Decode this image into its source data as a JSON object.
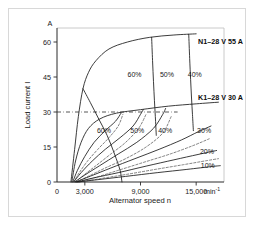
{
  "chart_data": {
    "type": "line",
    "title": "",
    "xlabel": "Alternator speed n",
    "ylabel": "Load current I",
    "x_unit": "min",
    "x_unit_exponent": "-1",
    "y_unit": "A",
    "xlim": [
      0,
      18000
    ],
    "ylim": [
      0,
      66
    ],
    "x_ticks": [
      0,
      3000,
      9000,
      15000
    ],
    "x_tick_labels": [
      "0",
      "3,000",
      "9,000",
      "15,000"
    ],
    "y_ticks": [
      0,
      15,
      30,
      45,
      60
    ],
    "y_tick_labels": [
      "0",
      "15",
      "30",
      "45",
      "60"
    ],
    "grid": false,
    "legend_position": "inline-right",
    "reference_lines": [
      {
        "name": "k1-rated-current",
        "axis": "y",
        "value": 30,
        "style": "dash-dot"
      }
    ],
    "annotations": [
      {
        "name": "series-label-n1",
        "text": "N1–28 V 55 A",
        "x": 15200,
        "y": 59
      },
      {
        "name": "series-label-k1",
        "text": "K1–28 V 30 A",
        "x": 15200,
        "y": 35
      },
      {
        "name": "duty-upper-60",
        "text": "60%",
        "x": 7600,
        "y": 45
      },
      {
        "name": "duty-upper-50",
        "text": "50%",
        "x": 11100,
        "y": 45
      },
      {
        "name": "duty-upper-40",
        "text": "40%",
        "x": 14100,
        "y": 45
      },
      {
        "name": "duty-lower-60",
        "text": "60%",
        "x": 4300,
        "y": 21
      },
      {
        "name": "duty-lower-50",
        "text": "50%",
        "x": 7900,
        "y": 21
      },
      {
        "name": "duty-lower-40",
        "text": "40%",
        "x": 10900,
        "y": 21
      },
      {
        "name": "duty-lower-30",
        "text": "30%",
        "x": 15100,
        "y": 21
      },
      {
        "name": "duty-lower-20",
        "text": "20%",
        "x": 15400,
        "y": 12
      },
      {
        "name": "duty-lower-10",
        "text": "10%",
        "x": 15500,
        "y": 6
      }
    ],
    "series": [
      {
        "name": "N1-28V-55A envelope",
        "style": "solid",
        "points": [
          [
            1500,
            0
          ],
          [
            1900,
            14
          ],
          [
            2300,
            28
          ],
          [
            2800,
            40
          ],
          [
            3400,
            47
          ],
          [
            4200,
            52
          ],
          [
            5600,
            57
          ],
          [
            7600,
            60
          ],
          [
            10000,
            62
          ],
          [
            12600,
            63
          ],
          [
            15000,
            63.5
          ]
        ]
      },
      {
        "name": "N1 duty 60%",
        "style": "solid",
        "points": [
          [
            2800,
            40
          ],
          [
            3600,
            34
          ],
          [
            4500,
            27
          ],
          [
            5400,
            20
          ],
          [
            6200,
            12
          ],
          [
            6800,
            5
          ],
          [
            7000,
            0
          ]
        ]
      },
      {
        "name": "N1 duty 50%",
        "style": "solid",
        "points": [
          [
            10200,
            62
          ],
          [
            10300,
            52
          ],
          [
            10400,
            43
          ],
          [
            10500,
            35
          ],
          [
            10600,
            28
          ],
          [
            10700,
            20
          ]
        ]
      },
      {
        "name": "N1 duty 40%",
        "style": "solid",
        "points": [
          [
            14200,
            63.3
          ],
          [
            14300,
            53
          ],
          [
            14400,
            44
          ],
          [
            14500,
            36
          ],
          [
            14600,
            29
          ],
          [
            14700,
            22
          ]
        ]
      },
      {
        "name": "K1-28V-30A envelope",
        "style": "solid",
        "points": [
          [
            1600,
            0
          ],
          [
            2000,
            9
          ],
          [
            2600,
            17
          ],
          [
            3400,
            23
          ],
          [
            4600,
            27
          ],
          [
            6400,
            29.5
          ],
          [
            9000,
            31
          ],
          [
            12000,
            32.5
          ],
          [
            15000,
            33.5
          ],
          [
            17400,
            34.2
          ]
        ]
      },
      {
        "name": "K1 duty 60% solid",
        "style": "solid",
        "points": [
          [
            1700,
            0
          ],
          [
            2200,
            5
          ],
          [
            3000,
            11
          ],
          [
            4000,
            17
          ],
          [
            5200,
            22
          ],
          [
            6300,
            26
          ],
          [
            6900,
            29.5
          ]
        ]
      },
      {
        "name": "K1 duty 60% dashed",
        "style": "dashed",
        "points": [
          [
            1800,
            0
          ],
          [
            2400,
            4
          ],
          [
            3300,
            9
          ],
          [
            4400,
            14
          ],
          [
            5600,
            19
          ],
          [
            6600,
            24
          ],
          [
            7100,
            29
          ]
        ]
      },
      {
        "name": "K1 duty 50% solid",
        "style": "solid",
        "points": [
          [
            1800,
            0
          ],
          [
            2600,
            4
          ],
          [
            3800,
            9
          ],
          [
            5200,
            14
          ],
          [
            6800,
            19
          ],
          [
            8200,
            24
          ],
          [
            9000,
            29
          ],
          [
            9300,
            31
          ]
        ]
      },
      {
        "name": "K1 duty 50% dashed",
        "style": "dashed",
        "points": [
          [
            2000,
            0
          ],
          [
            2900,
            3
          ],
          [
            4200,
            7
          ],
          [
            5800,
            12
          ],
          [
            7400,
            17
          ],
          [
            8800,
            23
          ],
          [
            9600,
            29
          ]
        ]
      },
      {
        "name": "K1 duty 40% solid",
        "style": "solid",
        "points": [
          [
            1900,
            0
          ],
          [
            3000,
            3
          ],
          [
            4600,
            7
          ],
          [
            6600,
            12
          ],
          [
            8600,
            17
          ],
          [
            10400,
            23
          ],
          [
            11400,
            29
          ],
          [
            11700,
            31.5
          ]
        ]
      },
      {
        "name": "K1 duty 40% dashed",
        "style": "dashed",
        "points": [
          [
            2100,
            0
          ],
          [
            3400,
            2.5
          ],
          [
            5200,
            6
          ],
          [
            7400,
            10
          ],
          [
            9600,
            15
          ],
          [
            11400,
            21
          ],
          [
            12300,
            28
          ]
        ]
      },
      {
        "name": "K1 duty 30%",
        "style": "solid",
        "points": [
          [
            2000,
            0
          ],
          [
            3600,
            2.5
          ],
          [
            5800,
            6
          ],
          [
            8400,
            10
          ],
          [
            11000,
            14
          ],
          [
            13400,
            18
          ],
          [
            15200,
            21.5
          ],
          [
            16600,
            24
          ]
        ]
      },
      {
        "name": "K1 duty 30% dashed",
        "style": "dashed",
        "points": [
          [
            2300,
            0
          ],
          [
            4200,
            2
          ],
          [
            6600,
            5
          ],
          [
            9400,
            8.5
          ],
          [
            12200,
            12
          ],
          [
            14600,
            15.5
          ],
          [
            16400,
            18.5
          ]
        ]
      },
      {
        "name": "K1 duty 20%",
        "style": "solid",
        "points": [
          [
            2100,
            0
          ],
          [
            4000,
            1.8
          ],
          [
            6600,
            4
          ],
          [
            9600,
            6.8
          ],
          [
            12600,
            9.5
          ],
          [
            15200,
            11.8
          ],
          [
            17200,
            13.5
          ]
        ]
      },
      {
        "name": "K1 duty 20% dashed",
        "style": "dashed",
        "points": [
          [
            2400,
            0
          ],
          [
            4600,
            1.4
          ],
          [
            7400,
            3.2
          ],
          [
            10600,
            5.4
          ],
          [
            13600,
            7.4
          ],
          [
            16200,
            9.2
          ],
          [
            17400,
            10
          ]
        ]
      },
      {
        "name": "K1 duty 10%",
        "style": "solid",
        "points": [
          [
            2200,
            0
          ],
          [
            4400,
            1
          ],
          [
            7400,
            2.4
          ],
          [
            10800,
            4
          ],
          [
            14000,
            5.4
          ],
          [
            16600,
            6.6
          ],
          [
            17600,
            7
          ]
        ]
      }
    ]
  }
}
